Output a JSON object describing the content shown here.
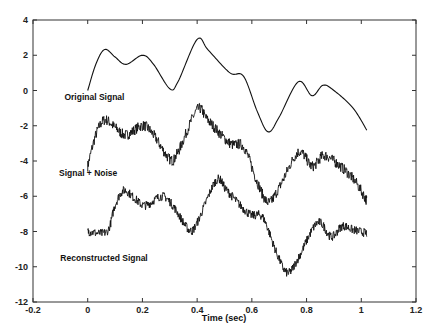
{
  "chart_data": {
    "type": "line",
    "title": "",
    "xlabel": "Time (sec)",
    "ylabel": "",
    "xlim": [
      -0.2,
      1.2
    ],
    "ylim": [
      -12,
      4
    ],
    "grid": false,
    "legend": "none (inline text labels)",
    "x_ticks": [
      "-0.2",
      "0",
      "0.2",
      "0.4",
      "0.6",
      "0.8",
      "1",
      "1.2"
    ],
    "x_tick_values": [
      -0.2,
      0,
      0.2,
      0.4,
      0.6,
      0.8,
      1.0,
      1.2
    ],
    "y_ticks": [
      "4",
      "2",
      "0",
      "-2",
      "-4",
      "-6",
      "-8",
      "-10",
      "-12"
    ],
    "y_tick_values": [
      4,
      2,
      0,
      -2,
      -4,
      -6,
      -8,
      -10,
      -12
    ],
    "series": [
      {
        "name": "Original Signal",
        "style": "smooth",
        "label_pos": [
          -0.085,
          -0.55
        ],
        "x": [
          0,
          0.03,
          0.062,
          0.1,
          0.14,
          0.2,
          0.24,
          0.3,
          0.33,
          0.4,
          0.44,
          0.52,
          0.57,
          0.62,
          0.66,
          0.7,
          0.77,
          0.82,
          0.86,
          0.9,
          0.97,
          1.02
        ],
        "values": [
          0,
          1.5,
          2.33,
          1.9,
          1.48,
          2.0,
          1.5,
          0.1,
          0.5,
          2.9,
          2.3,
          1.0,
          0.8,
          -1.2,
          -2.35,
          -1.5,
          0.5,
          -0.3,
          0.3,
          0.0,
          -1.0,
          -2.25
        ]
      },
      {
        "name": "Signal + Noise",
        "style": "noisy",
        "offset": -4,
        "noise_amplitude": 0.3,
        "label_pos": [
          -0.105,
          -4.85
        ],
        "x": [
          0,
          0.03,
          0.062,
          0.1,
          0.14,
          0.2,
          0.24,
          0.3,
          0.33,
          0.4,
          0.44,
          0.52,
          0.57,
          0.62,
          0.66,
          0.7,
          0.77,
          0.82,
          0.86,
          0.9,
          0.97,
          1.02
        ],
        "values": [
          -4.3,
          -2.5,
          -1.67,
          -2.1,
          -2.52,
          -2.0,
          -2.5,
          -3.9,
          -3.5,
          -1.1,
          -1.7,
          -3.0,
          -3.2,
          -5.2,
          -6.35,
          -5.5,
          -3.5,
          -4.3,
          -3.7,
          -4.0,
          -5.0,
          -6.25
        ]
      },
      {
        "name": "Reconstructed Signal",
        "style": "noisy",
        "offset": -8,
        "noise_amplitude": 0.25,
        "label_pos": [
          -0.1,
          -9.7
        ],
        "x": [
          0,
          0.07,
          0.1,
          0.132,
          0.17,
          0.21,
          0.27,
          0.31,
          0.37,
          0.4,
          0.47,
          0.51,
          0.59,
          0.64,
          0.69,
          0.73,
          0.77,
          0.84,
          0.89,
          0.93,
          0.97,
          1.02
        ],
        "values": [
          -8.0,
          -8.0,
          -6.5,
          -5.67,
          -6.1,
          -6.52,
          -6.0,
          -6.5,
          -7.9,
          -7.5,
          -5.1,
          -5.7,
          -7.0,
          -7.2,
          -9.2,
          -10.35,
          -9.5,
          -7.5,
          -8.3,
          -7.7,
          -7.9,
          -8.1
        ]
      }
    ]
  },
  "labels": {
    "original": "Original Signal",
    "noisy": "Signal + Noise",
    "reconstructed": "Reconstructed Signal",
    "xaxis": "Time (sec)"
  },
  "colors": {
    "line": "#111111",
    "axis": "#333333",
    "background": "#ffffff"
  }
}
